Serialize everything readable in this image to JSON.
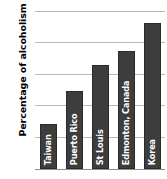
{
  "chart_data": {
    "type": "bar",
    "title": "",
    "xlabel": "",
    "ylabel": "Percentage of alcoholism",
    "categories": [
      "Taiwan",
      "Puerto Rico",
      "St Louis",
      "Edmonton, Canada",
      "Korea"
    ],
    "values": [
      7.2,
      12.4,
      16.5,
      18.7,
      23.1
    ],
    "ylim": [
      0,
      25
    ],
    "yticks": [
      0,
      5,
      10,
      15,
      20,
      25
    ],
    "ytick_labels": [
      "0",
      "5",
      "10",
      "15",
      "20",
      "25"
    ],
    "grid": true,
    "legend": "none",
    "bar_color": "#3d3d3d",
    "bar_label_color": "#ffffff",
    "grid_color": "#b9b9b9",
    "background_color": "#ffffff",
    "bar_labels_inside": true,
    "bar_label_orientation": "vertical"
  },
  "axis": {
    "y_title": "Percentage of alcoholism"
  }
}
